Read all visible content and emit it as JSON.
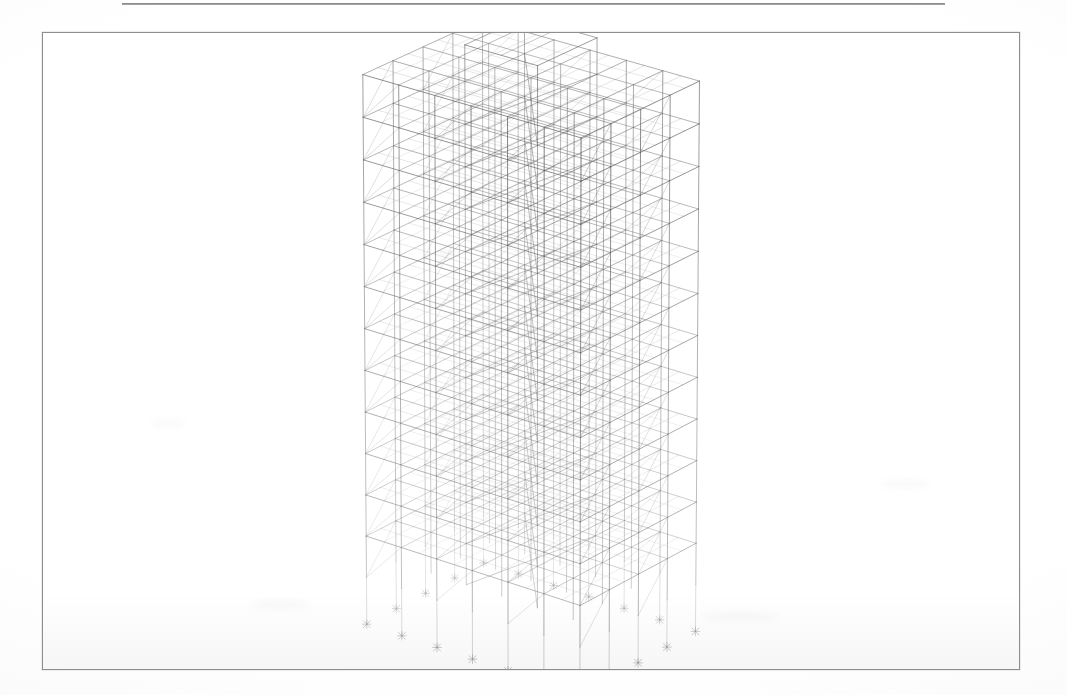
{
  "page": {
    "background_color": "#ffffff",
    "width": 1067,
    "height": 695,
    "header_rule": {
      "visible": true,
      "color": "#6f6f6f",
      "x": 122,
      "y": 3,
      "width": 823,
      "thickness": 2
    }
  },
  "figure": {
    "frame": {
      "x": 42,
      "y": 32,
      "width": 978,
      "height": 638,
      "border_color": "#8e8e8e",
      "border_width": 1,
      "fill": "#ffffff"
    },
    "caption": "",
    "type": "3d-wireframe-structural-model"
  },
  "model": {
    "title": "",
    "view": "3D perspective",
    "render_style": "wireframe",
    "line_color": "#585858",
    "hidden_line_color": "#b8b8b8",
    "accent_line_color": "#2e2e2e",
    "background": "#ffffff",
    "geometry": {
      "stories": 12,
      "bays_x": 6,
      "bays_y": 4,
      "story_height": 1.0,
      "bay_width_x": 1.0,
      "bay_width_y": 1.05,
      "has_roof_penthouse": true,
      "penthouse": {
        "i0": 2,
        "i1": 4,
        "j0": 1,
        "j1": 3,
        "height": 0.85
      },
      "support_type": "pinned",
      "support_symbol": "star-x",
      "base_extension": 1.15,
      "floor_grid_subdivisions": 2,
      "braced_frames": true
    },
    "projection": {
      "yaw_deg": 38,
      "pitch_deg": 23,
      "focal": 1500,
      "distance": 26,
      "scale": 52,
      "origin_x": 489,
      "origin_y": 300
    },
    "supports_count": 14
  },
  "artifacts": {
    "scan_smudges": [
      {
        "x": 250,
        "y": 600,
        "w": 60,
        "h": 10
      },
      {
        "x": 700,
        "y": 612,
        "w": 80,
        "h": 9
      },
      {
        "x": 430,
        "y": 250,
        "w": 30,
        "h": 8
      },
      {
        "x": 880,
        "y": 480,
        "w": 50,
        "h": 8
      },
      {
        "x": 150,
        "y": 420,
        "w": 36,
        "h": 7
      }
    ]
  }
}
